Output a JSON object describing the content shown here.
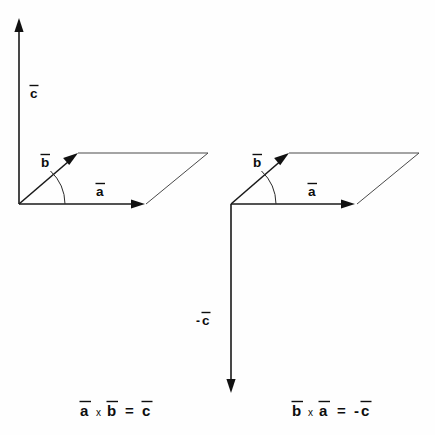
{
  "figure": {
    "background_color": "#fefefe",
    "ink_color": "#111111",
    "thin_color": "#4a4a4a"
  },
  "left_diagram": {
    "name": "a-cross-b-equals-c",
    "caption_lhs_first": "a",
    "caption_operator": "x",
    "caption_lhs_second": "b",
    "caption_equals": "=",
    "caption_rhs": "c",
    "caption_full": "a x b = c",
    "vectors": [
      {
        "symbol": "a",
        "label": "a",
        "direction": "right",
        "overbar": true
      },
      {
        "symbol": "b",
        "label": "b",
        "direction": "up-right",
        "overbar": true
      },
      {
        "symbol": "c",
        "label": "c",
        "direction": "up",
        "overbar": true
      }
    ],
    "label_a": "a",
    "label_b": "b",
    "label_c": "c"
  },
  "right_diagram": {
    "name": "b-cross-a-equals-minus-c",
    "caption_lhs_first": "b",
    "caption_operator": "x",
    "caption_lhs_second": "a",
    "caption_equals": "=",
    "caption_rhs_sign": "-",
    "caption_rhs": "c",
    "caption_full": "b x a = -c",
    "vectors": [
      {
        "symbol": "a",
        "label": "a",
        "direction": "right",
        "overbar": true
      },
      {
        "symbol": "b",
        "label": "b",
        "direction": "up-right",
        "overbar": true
      },
      {
        "symbol": "-c",
        "label": "c",
        "sign": "-",
        "direction": "down",
        "overbar": true
      }
    ],
    "label_a": "a",
    "label_b": "b",
    "label_minus_c_sign": "-",
    "label_minus_c": "c"
  }
}
